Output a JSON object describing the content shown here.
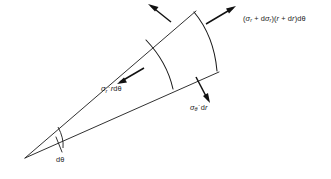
{
  "figure": {
    "kind": "stress-element-polar-coordinates",
    "background_color": "#ffffff",
    "stroke_color": "#1a1a1a"
  },
  "labels": {
    "outer_radial_force": {
      "name": "outer-radial-force-label",
      "text": "(σr + dσr)(r + dr)dθ",
      "parts": {
        "open": "(",
        "sigma": "σ",
        "sub_r": "r",
        "plus": " + d",
        "sigma2": "σ",
        "sub_r2": "r",
        "mid": ")(",
        "r_ital": "r",
        "plus2": " + d",
        "r_ital2": "r",
        "close": ")d",
        "theta": "θ"
      }
    },
    "inner_radial_force": {
      "name": "inner-radial-force-label",
      "text": "σr · r dθ",
      "parts": {
        "sigma": "σ",
        "sub_r": "r",
        "dot": "·",
        "r_ital": "r",
        "d": "d",
        "theta": "θ"
      }
    },
    "hoop_force": {
      "name": "hoop-force-label",
      "text": "σθ · dr",
      "parts": {
        "sigma": "σ",
        "sub_theta": "θ",
        "dot": "·",
        "d": "d",
        "r_ital": "r"
      }
    },
    "angle": {
      "name": "subtended-angle-label",
      "text": "dθ",
      "parts": {
        "d": "d",
        "theta": "θ"
      }
    }
  },
  "geometry": {
    "apex": {
      "x": 25,
      "y": 158
    },
    "upper_ray_end": {
      "x": 196,
      "y": 11
    },
    "lower_ray_end": {
      "x": 219,
      "y": 72
    },
    "inner_arc": {
      "start_x": 146,
      "start_y": 40,
      "end_x": 173,
      "end_y": 89
    },
    "outer_arc": {
      "start_x": 194,
      "start_y": 12,
      "end_x": 217,
      "end_y": 71
    },
    "angle_arc_radius": 37
  }
}
